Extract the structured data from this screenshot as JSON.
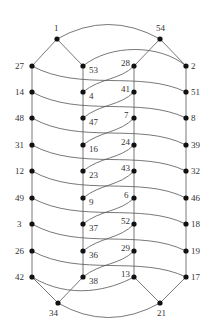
{
  "chart_data": {
    "type": "graph",
    "title": "",
    "nodes": [
      {
        "id": "1",
        "x": 57,
        "y": 39,
        "lx": 54,
        "ly": 31
      },
      {
        "id": "54",
        "x": 160,
        "y": 39,
        "lx": 156,
        "ly": 31
      },
      {
        "id": "27",
        "x": 32,
        "y": 66,
        "lx": 15,
        "ly": 69
      },
      {
        "id": "53",
        "x": 83,
        "y": 66,
        "lx": 89,
        "ly": 73
      },
      {
        "id": "28",
        "x": 134,
        "y": 66,
        "lx": 121,
        "ly": 66
      },
      {
        "id": "2",
        "x": 186,
        "y": 66,
        "lx": 191,
        "ly": 69
      },
      {
        "id": "14",
        "x": 32,
        "y": 92,
        "lx": 15,
        "ly": 95
      },
      {
        "id": "4",
        "x": 83,
        "y": 92,
        "lx": 89,
        "ly": 99
      },
      {
        "id": "41",
        "x": 134,
        "y": 92,
        "lx": 121,
        "ly": 92
      },
      {
        "id": "51",
        "x": 186,
        "y": 92,
        "lx": 191,
        "ly": 95
      },
      {
        "id": "48",
        "x": 32,
        "y": 118,
        "lx": 15,
        "ly": 121
      },
      {
        "id": "47",
        "x": 83,
        "y": 118,
        "lx": 89,
        "ly": 125
      },
      {
        "id": "7",
        "x": 134,
        "y": 118,
        "lx": 124,
        "ly": 118
      },
      {
        "id": "8",
        "x": 186,
        "y": 118,
        "lx": 191,
        "ly": 121
      },
      {
        "id": "31",
        "x": 32,
        "y": 145,
        "lx": 15,
        "ly": 148
      },
      {
        "id": "16",
        "x": 83,
        "y": 145,
        "lx": 89,
        "ly": 152
      },
      {
        "id": "24",
        "x": 134,
        "y": 145,
        "lx": 121,
        "ly": 145
      },
      {
        "id": "39",
        "x": 186,
        "y": 145,
        "lx": 191,
        "ly": 148
      },
      {
        "id": "12",
        "x": 32,
        "y": 171,
        "lx": 15,
        "ly": 174
      },
      {
        "id": "23",
        "x": 83,
        "y": 171,
        "lx": 89,
        "ly": 178
      },
      {
        "id": "43",
        "x": 134,
        "y": 171,
        "lx": 121,
        "ly": 171
      },
      {
        "id": "32",
        "x": 186,
        "y": 171,
        "lx": 191,
        "ly": 174
      },
      {
        "id": "49",
        "x": 32,
        "y": 198,
        "lx": 15,
        "ly": 201
      },
      {
        "id": "9",
        "x": 83,
        "y": 198,
        "lx": 89,
        "ly": 205
      },
      {
        "id": "6",
        "x": 134,
        "y": 198,
        "lx": 124,
        "ly": 198
      },
      {
        "id": "46",
        "x": 186,
        "y": 198,
        "lx": 191,
        "ly": 201
      },
      {
        "id": "3",
        "x": 32,
        "y": 224,
        "lx": 17,
        "ly": 227
      },
      {
        "id": "37",
        "x": 83,
        "y": 224,
        "lx": 89,
        "ly": 231
      },
      {
        "id": "52",
        "x": 134,
        "y": 224,
        "lx": 121,
        "ly": 224
      },
      {
        "id": "18",
        "x": 186,
        "y": 224,
        "lx": 191,
        "ly": 227
      },
      {
        "id": "26",
        "x": 32,
        "y": 251,
        "lx": 15,
        "ly": 254
      },
      {
        "id": "36",
        "x": 83,
        "y": 251,
        "lx": 89,
        "ly": 258
      },
      {
        "id": "29",
        "x": 134,
        "y": 251,
        "lx": 121,
        "ly": 251
      },
      {
        "id": "19",
        "x": 186,
        "y": 251,
        "lx": 191,
        "ly": 254
      },
      {
        "id": "42",
        "x": 32,
        "y": 277,
        "lx": 15,
        "ly": 280
      },
      {
        "id": "38",
        "x": 83,
        "y": 277,
        "lx": 89,
        "ly": 284
      },
      {
        "id": "13",
        "x": 134,
        "y": 277,
        "lx": 121,
        "ly": 277
      },
      {
        "id": "17",
        "x": 186,
        "y": 277,
        "lx": 191,
        "ly": 280
      },
      {
        "id": "34",
        "x": 58,
        "y": 303,
        "lx": 49,
        "ly": 316
      },
      {
        "id": "21",
        "x": 160,
        "y": 303,
        "lx": 157,
        "ly": 316
      }
    ],
    "edges": [
      {
        "d": "M57,39 Q108,10 160,39"
      },
      {
        "d": "M57,39 L32,66"
      },
      {
        "d": "M57,39 L83,66"
      },
      {
        "d": "M160,39 L134,66"
      },
      {
        "d": "M160,39 L186,66"
      },
      {
        "d": "M83,66 C110,44 160,44 186,66"
      },
      {
        "d": "M32,66 C80,92 140,70 186,92"
      },
      {
        "d": "M83,92 C100,78 120,80 134,66"
      },
      {
        "d": "M32,92 C80,118 140,96 186,118"
      },
      {
        "d": "M83,118 C100,104 120,106 134,92"
      },
      {
        "d": "M32,118 C80,145 140,122 186,145"
      },
      {
        "d": "M83,145 C100,131 120,133 134,118"
      },
      {
        "d": "M32,145 C80,171 140,149 186,171"
      },
      {
        "d": "M83,171 C100,157 120,159 134,145"
      },
      {
        "d": "M32,171 C80,198 140,175 186,198"
      },
      {
        "d": "M83,198 C100,184 120,186 134,171"
      },
      {
        "d": "M32,198 C80,224 140,202 186,224"
      },
      {
        "d": "M83,224 C100,210 120,212 134,198"
      },
      {
        "d": "M32,224 C80,251 140,228 186,251"
      },
      {
        "d": "M83,251 C100,237 120,239 134,224"
      },
      {
        "d": "M32,251 C80,277 140,255 186,277"
      },
      {
        "d": "M83,277 C100,263 120,265 134,251"
      },
      {
        "d": "M32,277 C70,300 110,290 134,277"
      },
      {
        "d": "M32,277 L58,303"
      },
      {
        "d": "M83,277 L58,303"
      },
      {
        "d": "M134,277 L160,303"
      },
      {
        "d": "M186,277 L160,303"
      },
      {
        "d": "M58,303 Q108,332 160,303"
      },
      {
        "d": "M32,66 L32,277"
      },
      {
        "d": "M83,66 L83,277"
      },
      {
        "d": "M134,66 L134,277"
      },
      {
        "d": "M186,66 L186,277"
      }
    ]
  }
}
